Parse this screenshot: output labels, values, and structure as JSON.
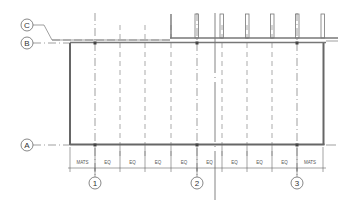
{
  "drawing": {
    "type": "architectural-plan-grid",
    "row_grids": [
      {
        "label": "C",
        "bubble_x": 27,
        "bubble_y": 25,
        "line_y": 40
      },
      {
        "label": "B",
        "bubble_x": 27,
        "bubble_y": 43,
        "line_y": 43
      },
      {
        "label": "A",
        "bubble_x": 27,
        "bubble_y": 145,
        "line_y": 145
      }
    ],
    "column_grids": [
      {
        "label": "1",
        "x": 95,
        "bubble_y": 183
      },
      {
        "label": "2",
        "x": 197,
        "bubble_y": 183
      },
      {
        "label": "3",
        "x": 297,
        "bubble_y": 183
      }
    ],
    "dimension_string": {
      "y": 168,
      "ticks_x": [
        70,
        95,
        120,
        145,
        171,
        197,
        222,
        247,
        272,
        297,
        323
      ],
      "labels": [
        "MATS",
        "EQ",
        "EQ",
        "EQ",
        "EQ",
        "EQ",
        "EQ",
        "EQ",
        "EQ",
        "MATS"
      ]
    },
    "colors": {
      "line": "#555555",
      "wall": "#666666",
      "background": "#ffffff"
    }
  }
}
